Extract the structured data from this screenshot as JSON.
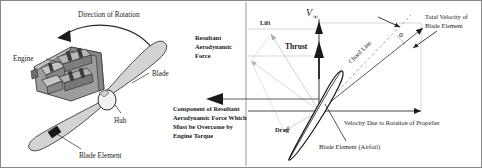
{
  "figure": {
    "colors": {
      "ink": "#1a1a1a",
      "line": "#555555",
      "faint": "#b8b8b8",
      "blade_fill": "#d9d9d9",
      "engine_fill": "#9a9a9a",
      "engine_dark": "#6f6f6f",
      "engine_light": "#c2c2c2",
      "hub_fill": "#efefef",
      "border": "#888888"
    }
  },
  "left_panel": {
    "labels": {
      "direction_of_rotation": "Direction of Rotation",
      "engine": "Engine",
      "blade": "Blade",
      "hub": "Hub",
      "blade_element": "Blade Element"
    }
  },
  "right_panel": {
    "labels": {
      "resultant_aero_force": [
        "Resultant",
        "Aerodynamic",
        "Force"
      ],
      "lift": "Lift",
      "drag": "Drag",
      "thrust": "Thrust",
      "v_infinity": "V",
      "v_infinity_sub": "∞",
      "alpha": "α",
      "chord_line": "Chord Line",
      "total_velocity": [
        "Total Velocity of",
        "Blade Element"
      ],
      "velocity_rotation": "Velocity Due to Rotation of Propeller",
      "blade_element_airfoil": "Blade Element (Airfoil)",
      "torque_component": [
        "Component of Resultant",
        "Aerodynamic Force Which",
        "Must be Overcome by",
        "Engine Torque"
      ]
    }
  }
}
